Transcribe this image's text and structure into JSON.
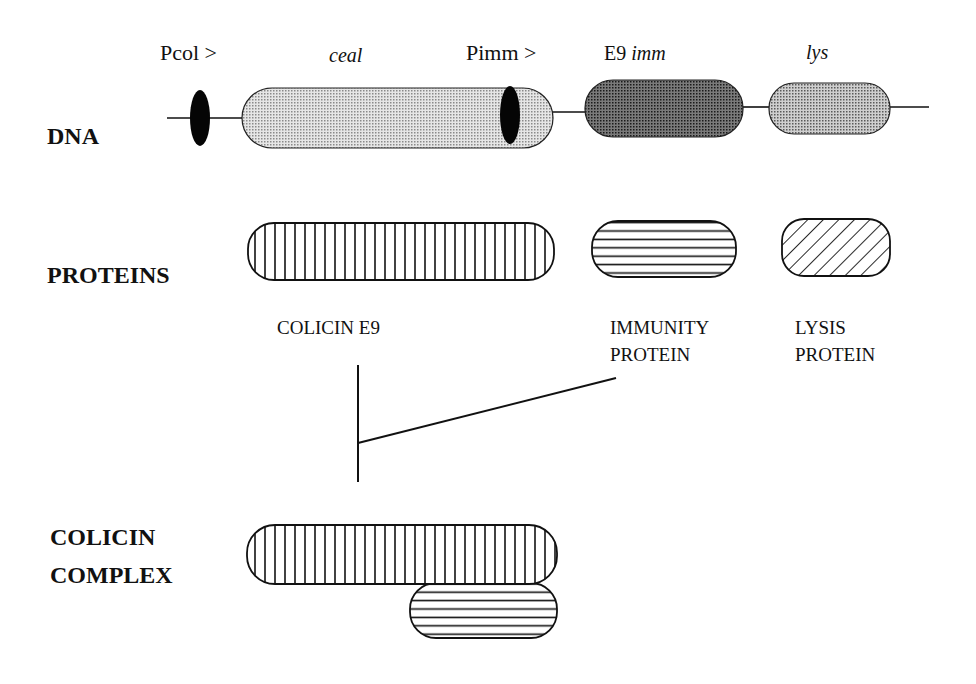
{
  "rows": {
    "dna": "DNA",
    "proteins": "PROTEINS",
    "complex_line1": "COLICIN",
    "complex_line2": "COMPLEX"
  },
  "dna_labels": {
    "pcol": "Pcol >",
    "ceal": "ceal",
    "pimm": "Pimm >",
    "e9_prefix": "E9",
    "imm": "imm",
    "lys": "lys"
  },
  "protein_labels": {
    "colicin": "COLICIN  E9",
    "immunity_line1": "IMMUNITY",
    "immunity_line2": "PROTEIN",
    "lysis_line1": "LYSIS",
    "lysis_line2": "PROTEIN"
  },
  "colors": {
    "ink": "#111111",
    "ceal_fill": "#d4d4d4",
    "imm_fill": "#6a6a6a",
    "lys_fill": "#b8b8b8",
    "promoter": "#050505"
  }
}
